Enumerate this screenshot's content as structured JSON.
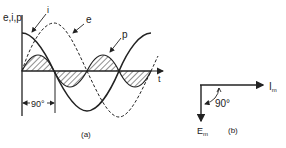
{
  "figure_a": {
    "y_axis_label": "e,i,p",
    "x_axis_label": "t",
    "curve_labels": {
      "current": "i",
      "voltage": "e",
      "power": "p"
    },
    "phase_marker": "90°",
    "caption": "(a)"
  },
  "figure_b": {
    "current_phasor_label": "I",
    "current_phasor_sub": "m",
    "voltage_phasor_label": "E",
    "voltage_phasor_sub": "m",
    "angle_label": "90°",
    "caption": "(b)"
  },
  "colors": {
    "ink": "#222222",
    "background": "#ffffff"
  }
}
